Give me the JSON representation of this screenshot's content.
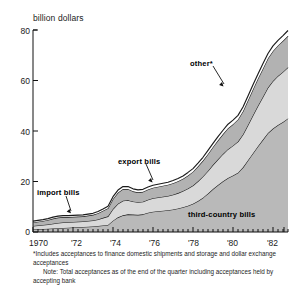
{
  "chart_data": {
    "type": "area",
    "stacked": true,
    "title": "",
    "ylabel": "billion dollars",
    "xlabel": "",
    "ylim": [
      0,
      80
    ],
    "yticks": [
      0,
      20,
      40,
      60,
      80
    ],
    "xlim": [
      1970,
      1982.75
    ],
    "xticks": [
      1970,
      1972,
      1974,
      1976,
      1978,
      1980,
      1982
    ],
    "xtick_labels": [
      "1970",
      "'72",
      "'74",
      "'76",
      "'78",
      "'80",
      "'82"
    ],
    "minor_tick_interval_years": 0.25,
    "grid": false,
    "legend": "inline-annotations",
    "x": [
      1970.0,
      1970.25,
      1970.5,
      1970.75,
      1971.0,
      1971.25,
      1971.5,
      1971.75,
      1972.0,
      1972.25,
      1972.5,
      1972.75,
      1973.0,
      1973.25,
      1973.5,
      1973.75,
      1974.0,
      1974.25,
      1974.5,
      1974.75,
      1975.0,
      1975.25,
      1975.5,
      1975.75,
      1976.0,
      1976.25,
      1976.5,
      1976.75,
      1977.0,
      1977.25,
      1977.5,
      1977.75,
      1978.0,
      1978.25,
      1978.5,
      1978.75,
      1979.0,
      1979.25,
      1979.5,
      1979.75,
      1980.0,
      1980.25,
      1980.5,
      1980.75,
      1981.0,
      1981.25,
      1981.5,
      1981.75,
      1982.0,
      1982.25,
      1982.5,
      1982.75
    ],
    "series": [
      {
        "name": "third-country bills",
        "fill": "#b9b9b9",
        "values": [
          1.0,
          1.1,
          1.2,
          1.3,
          1.4,
          1.5,
          1.6,
          1.7,
          1.8,
          1.9,
          2.0,
          2.1,
          2.2,
          2.4,
          2.6,
          2.8,
          4.5,
          5.8,
          6.6,
          7.0,
          6.9,
          6.8,
          7.0,
          7.6,
          8.0,
          8.2,
          8.4,
          8.6,
          8.9,
          9.3,
          9.8,
          10.4,
          11.2,
          12.3,
          13.6,
          15.2,
          17.0,
          18.6,
          20.1,
          21.4,
          22.4,
          23.5,
          25.6,
          28.4,
          31.2,
          34.0,
          36.6,
          39.2,
          41.0,
          42.4,
          43.6,
          45.0
        ]
      },
      {
        "name": "export bills",
        "fill": "#d9d9d9",
        "values": [
          1.4,
          1.5,
          1.6,
          1.7,
          1.9,
          2.1,
          2.2,
          2.2,
          2.2,
          2.2,
          2.2,
          2.3,
          2.4,
          2.6,
          3.0,
          3.4,
          4.6,
          5.4,
          5.8,
          5.6,
          5.2,
          5.0,
          5.0,
          5.2,
          5.4,
          5.5,
          5.6,
          5.7,
          5.9,
          6.1,
          6.4,
          6.8,
          7.2,
          7.8,
          8.4,
          9.0,
          9.6,
          10.2,
          10.8,
          11.4,
          11.8,
          12.3,
          13.0,
          14.0,
          15.0,
          16.0,
          17.0,
          18.0,
          18.8,
          19.4,
          19.8,
          20.2
        ]
      },
      {
        "name": "import bills",
        "fill": "#b2b2b2",
        "values": [
          1.4,
          1.5,
          1.6,
          1.8,
          2.0,
          2.1,
          2.1,
          2.0,
          2.0,
          2.0,
          2.0,
          2.1,
          2.2,
          2.4,
          2.8,
          3.2,
          4.0,
          4.4,
          4.6,
          4.4,
          4.0,
          3.9,
          3.9,
          4.0,
          4.1,
          4.2,
          4.3,
          4.4,
          4.5,
          4.7,
          4.9,
          5.2,
          5.5,
          5.9,
          6.3,
          6.7,
          7.1,
          7.5,
          7.9,
          8.3,
          8.5,
          8.8,
          9.2,
          9.8,
          10.3,
          10.8,
          11.2,
          11.6,
          11.9,
          12.1,
          12.3,
          12.5
        ]
      },
      {
        "name": "other*",
        "fill": "#ffffff",
        "values": [
          0.5,
          0.5,
          0.5,
          0.5,
          0.6,
          0.6,
          0.6,
          0.6,
          0.6,
          0.6,
          0.6,
          0.6,
          0.6,
          0.7,
          0.7,
          0.8,
          0.9,
          1.0,
          1.0,
          1.0,
          1.0,
          1.0,
          1.0,
          1.0,
          1.0,
          1.0,
          1.0,
          1.0,
          1.1,
          1.1,
          1.1,
          1.2,
          1.2,
          1.3,
          1.3,
          1.4,
          1.4,
          1.5,
          1.5,
          1.6,
          1.6,
          1.6,
          1.7,
          1.7,
          1.8,
          1.8,
          1.9,
          1.9,
          2.0,
          2.0,
          2.1,
          2.1
        ]
      }
    ],
    "annotations": [
      {
        "label": "other*",
        "x": 1979.0,
        "y": 57.0
      },
      {
        "label": "export bills",
        "x": 1975.4,
        "y": 22.5
      },
      {
        "label": "import bills",
        "x": 1970.9,
        "y": 13.0
      },
      {
        "label": "third-country bills",
        "x": 1979.6,
        "y": 6.5
      }
    ]
  },
  "axis": {
    "y_title": "billion dollars",
    "y_labels": [
      "80",
      "60",
      "40",
      "20",
      "0"
    ],
    "x_labels": [
      "1970",
      "'72",
      "'74",
      "'76",
      "'78",
      "'80",
      "'82"
    ]
  },
  "labels": {
    "other": "other*",
    "export_bills": "export bills",
    "import_bills": "import bills",
    "third_country_bills": "third-country bills"
  },
  "footnotes": {
    "asterisk": "*Includes acceptances to finance domestic shipments and storage and dollar exchange acceptances",
    "note": "Note: Total acceptances as of the end of the quarter including acceptances held by accepting bank"
  }
}
